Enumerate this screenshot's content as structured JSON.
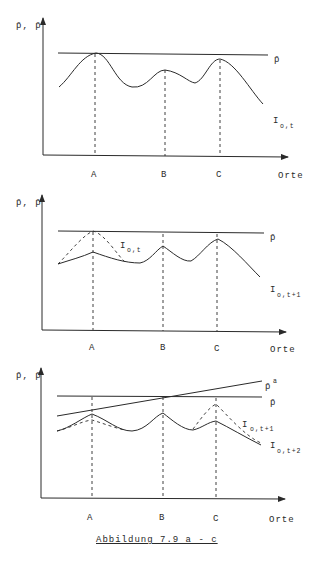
{
  "figure": {
    "caption": "Abbildung 7.9 a - c",
    "panels": [
      {
        "id": "a",
        "y_label": "p̄, p̄",
        "x_label": "Orte",
        "x_ticks": [
          "A",
          "B",
          "C"
        ],
        "lines": [
          {
            "label": "p̄",
            "type": "horizontal"
          },
          {
            "label": "I",
            "subscript": "o,t",
            "type": "solid-curve"
          }
        ]
      },
      {
        "id": "b",
        "y_label": "p̄, p̄",
        "x_label": "Orte",
        "x_ticks": [
          "A",
          "B",
          "C"
        ],
        "lines": [
          {
            "label": "p̄",
            "type": "horizontal"
          },
          {
            "label": "I",
            "subscript": "o,t",
            "type": "dashed-curve"
          },
          {
            "label": "I",
            "subscript": "o,t+1",
            "type": "solid-curve"
          }
        ]
      },
      {
        "id": "c",
        "y_label": "p̄, p̄",
        "x_label": "Orte",
        "x_ticks": [
          "A",
          "B",
          "C"
        ],
        "lines": [
          {
            "label": "p̄",
            "superscript": "a",
            "type": "rising-line"
          },
          {
            "label": "p̄",
            "type": "horizontal"
          },
          {
            "label": "I",
            "subscript": "o,t+1",
            "type": "dashed-curve"
          },
          {
            "label": "I",
            "subscript": "o,t+2",
            "type": "solid-curve"
          }
        ]
      }
    ]
  }
}
